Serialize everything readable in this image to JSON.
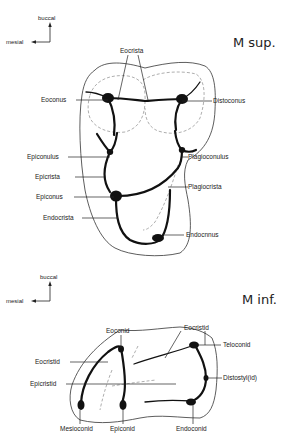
{
  "upper_molar": {
    "title": "M sup.",
    "orientation": {
      "vertical": "buccal",
      "horizontal": "mesial"
    },
    "labels": {
      "eocrista": "Eocrista",
      "eoconus": "Eoconus",
      "distoconus": "Distoconus",
      "epiconulus": "Epiconulus",
      "plagioconulus": "Plagioconulus",
      "epicrista": "Epicrista",
      "plagiocrista": "Plagiocrista",
      "epiconus": "Epiconus",
      "endocrista": "Endocrista",
      "endoconus": "Endocnnus"
    }
  },
  "lower_molar": {
    "title": "M inf.",
    "orientation": {
      "vertical": "buccal",
      "horizontal": "mesial"
    },
    "labels": {
      "eoconid": "Eoconid",
      "eocristid_top": "Eocristid",
      "teloconid": "Teloconid",
      "eocristid_left": "Eocristid",
      "epicristid": "Epicristid",
      "distostylid": "Distostyl(id)",
      "mesioconid": "Mesioconid",
      "epiconid": "Epiconid",
      "endoconid": "Endoconid"
    }
  }
}
